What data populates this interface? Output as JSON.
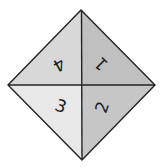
{
  "diagram": {
    "title": "",
    "shape": "diamond divided into four triangular quadrants",
    "vertices": {
      "top": [
        81,
        10
      ],
      "right": [
        155,
        85
      ],
      "bottom": [
        82,
        160
      ],
      "left": [
        8,
        85
      ],
      "center": [
        82,
        85
      ]
    },
    "line_color": "#222222",
    "quadrants": [
      {
        "position": "top-right",
        "label": "1",
        "fill": "#c0c0c0",
        "rotation_deg": 225
      },
      {
        "position": "bottom-right",
        "label": "2",
        "fill": "#c6c6c6",
        "rotation_deg": -70
      },
      {
        "position": "bottom-left",
        "label": "3",
        "fill": "#e8e8e8",
        "rotation_deg": 20
      },
      {
        "position": "top-left",
        "label": "4",
        "fill": "#d8d8d8",
        "rotation_deg": 150
      }
    ]
  }
}
